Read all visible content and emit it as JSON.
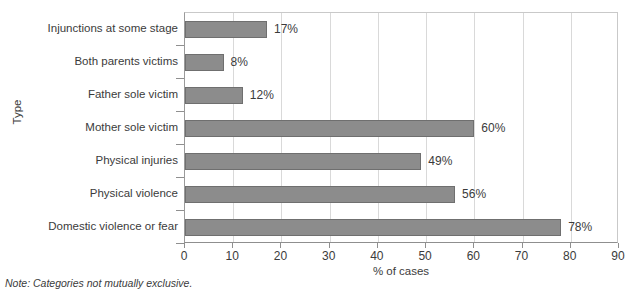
{
  "chart_data": {
    "type": "bar",
    "orientation": "horizontal",
    "title": "",
    "xlabel": "% of cases",
    "ylabel": "Type",
    "xlim": [
      0,
      90
    ],
    "xticks": [
      0,
      10,
      20,
      30,
      40,
      50,
      60,
      70,
      80,
      90
    ],
    "xtick_labels": [
      "0",
      "10",
      "20",
      "30",
      "40",
      "50",
      "60",
      "70",
      "80",
      "90"
    ],
    "grid": true,
    "grid_axis": "x",
    "legend": false,
    "categories": [
      "Injunctions at some stage",
      "Both parents victims",
      "Father sole victim",
      "Mother sole victim",
      "Physical injuries",
      "Physical violence",
      "Domestic violence or fear"
    ],
    "values": [
      17,
      8,
      12,
      60,
      49,
      56,
      78
    ],
    "data_labels": [
      "17%",
      "8%",
      "12%",
      "60%",
      "49%",
      "56%",
      "78%"
    ],
    "bar_color": "#8c8c8c",
    "bar_edge_color": "#6f6f6f",
    "grid_color": "#d9d9d9",
    "axis_color": "#8f8f8f",
    "text_color": "#3b3b3b",
    "background": "#ffffff"
  },
  "note": "Note: Categories not mutually exclusive."
}
